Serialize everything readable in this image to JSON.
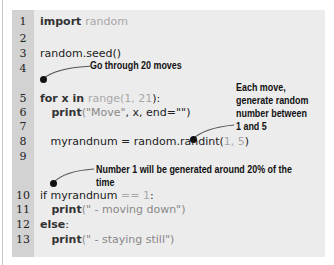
{
  "code": {
    "lines": [
      {
        "num": "1",
        "parts": [
          {
            "t": "import ",
            "k": "kw"
          },
          {
            "t": "random",
            "k": "lit"
          }
        ]
      },
      {
        "num": "2",
        "parts": []
      },
      {
        "num": "3",
        "parts": [
          {
            "t": "random.seed()",
            "k": ""
          }
        ]
      },
      {
        "num": "4",
        "parts": []
      },
      {
        "num": "5",
        "parts": [
          {
            "t": "for x ",
            "k": "kw"
          },
          {
            "t": "in ",
            "k": "kw"
          },
          {
            "t": "range(",
            "k": "lit"
          },
          {
            "t": "1, 21",
            "k": "lit"
          },
          {
            "t": "):",
            "k": ""
          }
        ]
      },
      {
        "num": "6",
        "parts": [
          {
            "t": "   print",
            "k": "kw"
          },
          {
            "t": "(\"Move\"",
            "k": "str"
          },
          {
            "t": ", x, end=\"\")",
            "k": ""
          }
        ]
      },
      {
        "num": "7",
        "parts": []
      },
      {
        "num": "8",
        "parts": [
          {
            "t": "   myrandnum = random.randint(",
            "k": ""
          },
          {
            "t": "1, 5",
            "k": "lit"
          },
          {
            "t": ")",
            "k": ""
          }
        ]
      },
      {
        "num": "9",
        "parts": []
      },
      {
        "num": "10",
        "parts": [
          {
            "t": "if myrandnum ",
            "k": ""
          },
          {
            "t": "== 1",
            "k": "lit"
          },
          {
            "t": ":",
            "k": ""
          }
        ]
      },
      {
        "num": "11",
        "parts": [
          {
            "t": "   print",
            "k": "kw"
          },
          {
            "t": "(\" - moving down\")",
            "k": "str"
          }
        ]
      },
      {
        "num": "12",
        "parts": [
          {
            "t": "else",
            "k": "kw"
          },
          {
            "t": ":",
            "k": ""
          }
        ]
      },
      {
        "num": "13",
        "parts": [
          {
            "t": "   print",
            "k": "kw"
          },
          {
            "t": "(\" - staying still\")",
            "k": "str"
          }
        ]
      }
    ]
  },
  "annotations": {
    "moves": "Go through 20 moves",
    "each_move": [
      "Each move,",
      "generate random",
      "number between",
      "1 and 5"
    ],
    "number_one": "Number 1 will be generated around 20% of the time"
  }
}
